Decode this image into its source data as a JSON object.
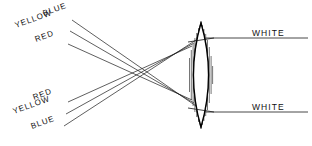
{
  "diagram": {
    "background_color": "#ffffff",
    "line_color": "#1a1a1a",
    "lens_fill": "#ffffff",
    "lens_stroke": "#000000"
  },
  "labels": {
    "incoming_top": [
      {
        "text": "BLUE",
        "x": 44,
        "y": 16,
        "rotation": -20
      },
      {
        "text": "YELLOW",
        "x": 16,
        "y": 28,
        "rotation": -20
      },
      {
        "text": "RED",
        "x": 36,
        "y": 42,
        "rotation": -20
      }
    ],
    "incoming_bottom": [
      {
        "text": "RED",
        "x": 34,
        "y": 100,
        "rotation": -20
      },
      {
        "text": "YELLOW",
        "x": 14,
        "y": 114,
        "rotation": -20
      },
      {
        "text": "BLUE",
        "x": 32,
        "y": 129,
        "rotation": -20
      }
    ],
    "outgoing": [
      {
        "text": "WHITE",
        "x": 252,
        "y": 36,
        "rotation": 0
      },
      {
        "text": "WHITE",
        "x": 252,
        "y": 110,
        "rotation": 0
      }
    ]
  },
  "rays": {
    "top_group": [
      {
        "name": "blue-ray-top",
        "x1": 72,
        "y1": 20,
        "x2": 196,
        "y2": 106
      },
      {
        "name": "yellow-ray-top",
        "x1": 70,
        "y1": 31,
        "x2": 194,
        "y2": 103
      },
      {
        "name": "red-ray-top",
        "x1": 68,
        "y1": 44,
        "x2": 192,
        "y2": 100
      }
    ],
    "bottom_group": [
      {
        "name": "red-ray-bottom",
        "x1": 68,
        "y1": 102,
        "x2": 192,
        "y2": 46
      },
      {
        "name": "yellow-ray-bottom",
        "x1": 66,
        "y1": 114,
        "x2": 194,
        "y2": 43
      },
      {
        "name": "blue-ray-bottom",
        "x1": 64,
        "y1": 126,
        "x2": 196,
        "y2": 40
      }
    ],
    "crossing_point": {
      "x": 135,
      "y": 73
    },
    "exit_rays": [
      {
        "name": "white-ray-top",
        "x1": 206,
        "y1": 38,
        "x2": 308,
        "y2": 38
      },
      {
        "name": "white-ray-bottom",
        "x1": 206,
        "y1": 112,
        "x2": 308,
        "y2": 112
      }
    ]
  },
  "lens": {
    "center_x": 201,
    "top_y": 23,
    "bottom_y": 127,
    "half_width": 15,
    "hatch_count": 13,
    "chords": [
      {
        "name": "upper-chord",
        "x1": 188,
        "y1": 42,
        "x2": 214,
        "y2": 38
      },
      {
        "name": "lower-chord",
        "x1": 188,
        "y1": 108,
        "x2": 214,
        "y2": 112
      }
    ]
  }
}
